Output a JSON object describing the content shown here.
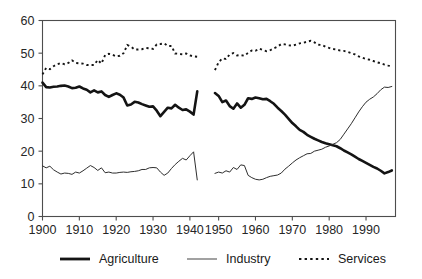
{
  "chart_data": {
    "type": "line",
    "title": "",
    "subtitle": "",
    "xlabel": "",
    "ylabel": "",
    "xlim": [
      1900,
      1998
    ],
    "ylim": [
      0,
      60
    ],
    "grid": false,
    "legend_position": "bottom",
    "y_ticks": [
      "0",
      "10",
      "20",
      "30",
      "40",
      "50",
      "60"
    ],
    "y_tick_values": [
      0,
      10,
      20,
      30,
      40,
      50,
      60
    ],
    "x_ticks": [
      "1900",
      "1910",
      "1920",
      "1930",
      "1940",
      "1950",
      "1960",
      "1970",
      "1980",
      "1990"
    ],
    "x_tick_values": [
      1900,
      1910,
      1920,
      1930,
      1940,
      1950,
      1960,
      1970,
      1980,
      1990
    ],
    "data_gap": [
      1943,
      1949
    ],
    "note": "Series are broken between 1943 and 1949 (no data plotted).",
    "series": [
      {
        "name": "Agriculture",
        "style": "thick-solid",
        "color": "#141414",
        "segments": [
          {
            "x": [
              1900,
              1901,
              1902,
              1903,
              1904,
              1905,
              1906,
              1907,
              1908,
              1909,
              1910,
              1911,
              1912,
              1913,
              1914,
              1915,
              1916,
              1917,
              1918,
              1919,
              1920,
              1921,
              1922,
              1923,
              1924,
              1925,
              1926,
              1927,
              1928,
              1929,
              1930,
              1931,
              1932,
              1933,
              1934,
              1935,
              1936,
              1937,
              1938,
              1939,
              1940,
              1941,
              1942
            ],
            "y": [
              41.0,
              39.6,
              39.5,
              39.7,
              39.8,
              40.0,
              40.1,
              39.8,
              39.3,
              39.4,
              39.8,
              39.2,
              38.8,
              38.0,
              38.6,
              38.0,
              38.3,
              37.2,
              36.6,
              37.2,
              37.7,
              37.3,
              36.4,
              34.0,
              34.3,
              35.1,
              34.9,
              34.4,
              34.0,
              33.6,
              33.7,
              32.4,
              30.7,
              32.0,
              33.3,
              33.1,
              34.2,
              33.3,
              32.6,
              32.8,
              32.1,
              31.2,
              38.3
            ]
          },
          {
            "x": [
              1949,
              1950,
              1951,
              1952,
              1953,
              1954,
              1955,
              1956,
              1957,
              1958,
              1959,
              1960,
              1961,
              1962,
              1963,
              1964,
              1965,
              1966,
              1967,
              1968,
              1969,
              1970,
              1971,
              1972,
              1973,
              1974,
              1975,
              1976,
              1977,
              1978,
              1979,
              1980,
              1981,
              1982,
              1983,
              1984,
              1985,
              1986,
              1987,
              1988,
              1989,
              1990,
              1991,
              1992,
              1993,
              1994,
              1995,
              1996,
              1997
            ],
            "y": [
              37.8,
              36.9,
              35.0,
              35.5,
              33.8,
              33.0,
              34.6,
              33.3,
              34.2,
              36.2,
              36.0,
              36.4,
              36.2,
              35.9,
              36.0,
              35.3,
              34.5,
              33.3,
              32.3,
              31.2,
              29.9,
              28.6,
              27.6,
              26.5,
              25.9,
              25.0,
              24.4,
              23.8,
              23.3,
              22.8,
              22.4,
              22.1,
              21.8,
              21.5,
              20.9,
              20.2,
              19.6,
              19.0,
              18.3,
              17.6,
              17.0,
              16.4,
              15.8,
              15.2,
              14.7,
              14.0,
              13.2,
              13.6,
              14.1
            ]
          }
        ]
      },
      {
        "name": "Industry",
        "style": "thin-solid",
        "color": "#2e2e2e",
        "segments": [
          {
            "x": [
              1900,
              1901,
              1902,
              1903,
              1904,
              1905,
              1906,
              1907,
              1908,
              1909,
              1910,
              1911,
              1912,
              1913,
              1914,
              1915,
              1916,
              1917,
              1918,
              1919,
              1920,
              1921,
              1922,
              1923,
              1924,
              1925,
              1926,
              1927,
              1928,
              1929,
              1930,
              1931,
              1932,
              1933,
              1934,
              1935,
              1936,
              1937,
              1938,
              1939,
              1940,
              1941,
              1942
            ],
            "y": [
              15.5,
              14.9,
              15.4,
              14.3,
              13.6,
              13.0,
              13.3,
              13.2,
              12.9,
              13.6,
              13.3,
              14.0,
              14.8,
              15.6,
              15.0,
              14.1,
              14.9,
              13.4,
              13.6,
              13.3,
              13.3,
              13.5,
              13.6,
              13.5,
              13.7,
              13.8,
              14.0,
              14.4,
              14.4,
              14.9,
              15.0,
              14.9,
              13.6,
              12.6,
              13.3,
              14.7,
              15.9,
              16.9,
              17.8,
              17.3,
              18.6,
              19.8,
              11.2
            ]
          },
          {
            "x": [
              1949,
              1950,
              1951,
              1952,
              1953,
              1954,
              1955,
              1956,
              1957,
              1958,
              1959,
              1960,
              1961,
              1962,
              1963,
              1964,
              1965,
              1966,
              1967,
              1968,
              1969,
              1970,
              1971,
              1972,
              1973,
              1974,
              1975,
              1976,
              1977,
              1978,
              1979,
              1980,
              1981,
              1982,
              1983,
              1984,
              1985,
              1986,
              1987,
              1988,
              1989,
              1990,
              1991,
              1992,
              1993,
              1994,
              1995,
              1996,
              1997
            ],
            "y": [
              13.2,
              13.6,
              13.3,
              14.0,
              13.6,
              15.0,
              14.4,
              15.8,
              15.6,
              12.6,
              11.9,
              11.4,
              11.2,
              11.4,
              11.9,
              12.3,
              12.5,
              12.7,
              13.3,
              14.5,
              15.4,
              16.4,
              17.3,
              18.0,
              18.6,
              19.2,
              19.3,
              20.0,
              20.3,
              20.6,
              21.2,
              21.6,
              22.1,
              22.6,
              23.6,
              25.2,
              26.8,
              28.4,
              30.2,
              32.0,
              33.6,
              35.0,
              35.9,
              36.6,
              37.6,
              38.8,
              39.6,
              39.5,
              39.8
            ]
          }
        ]
      },
      {
        "name": "Services",
        "style": "dotted",
        "color": "#141414",
        "segments": [
          {
            "x": [
              1900,
              1901,
              1902,
              1903,
              1904,
              1905,
              1906,
              1907,
              1908,
              1909,
              1910,
              1911,
              1912,
              1913,
              1914,
              1915,
              1916,
              1917,
              1918,
              1919,
              1920,
              1921,
              1922,
              1923,
              1924,
              1925,
              1926,
              1927,
              1928,
              1929,
              1930,
              1931,
              1932,
              1933,
              1934,
              1935,
              1936,
              1937,
              1938,
              1939,
              1940,
              1941,
              1942
            ],
            "y": [
              43.5,
              45.5,
              45.1,
              46.0,
              46.6,
              47.0,
              46.6,
              47.0,
              47.8,
              47.0,
              46.9,
              46.8,
              46.4,
              46.4,
              46.4,
              47.9,
              46.8,
              49.4,
              49.8,
              49.5,
              49.0,
              49.2,
              50.0,
              52.5,
              52.0,
              51.1,
              51.1,
              51.2,
              51.6,
              51.5,
              51.3,
              52.7,
              52.8,
              53.0,
              52.2,
              52.2,
              49.9,
              49.8,
              49.6,
              49.9,
              49.3,
              49.0,
              48.9
            ]
          },
          {
            "x": [
              1949,
              1950,
              1951,
              1952,
              1953,
              1954,
              1955,
              1956,
              1957,
              1958,
              1959,
              1960,
              1961,
              1962,
              1963,
              1964,
              1965,
              1966,
              1967,
              1968,
              1969,
              1970,
              1971,
              1972,
              1973,
              1974,
              1975,
              1976,
              1977,
              1978,
              1979,
              1980,
              1981,
              1982,
              1983,
              1984,
              1985,
              1986,
              1987,
              1988,
              1989,
              1990,
              1991,
              1992,
              1993,
              1994,
              1995,
              1996,
              1997
            ],
            "y": [
              44.8,
              47.2,
              48.4,
              48.2,
              49.6,
              50.0,
              49.3,
              49.4,
              49.2,
              50.1,
              50.8,
              50.7,
              51.4,
              51.0,
              50.6,
              50.9,
              51.5,
              52.0,
              52.8,
              52.7,
              52.4,
              52.3,
              52.6,
              53.0,
              53.2,
              53.5,
              53.8,
              53.3,
              52.6,
              52.5,
              52.0,
              51.6,
              51.3,
              51.1,
              50.8,
              50.7,
              50.4,
              50.0,
              49.6,
              49.0,
              48.6,
              48.2,
              48.0,
              47.6,
              47.2,
              46.9,
              46.5,
              46.2,
              46.0
            ]
          }
        ]
      }
    ],
    "legend": [
      {
        "label": "Agriculture",
        "style": "thick-solid"
      },
      {
        "label": "Industry",
        "style": "thin-solid"
      },
      {
        "label": "Services",
        "style": "dotted"
      }
    ]
  },
  "legend_labels": {
    "agriculture": "Agriculture",
    "industry": "Industry",
    "services": "Services"
  }
}
